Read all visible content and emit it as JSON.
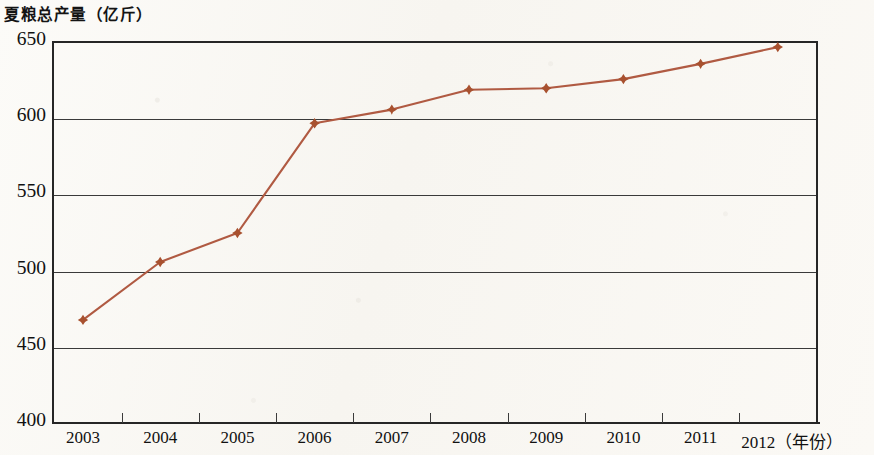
{
  "chart_data": {
    "type": "line",
    "title": "夏粮总产量（亿斤）",
    "xlabel": "（年份）",
    "ylabel": "",
    "categories": [
      "2003",
      "2004",
      "2005",
      "2006",
      "2007",
      "2008",
      "2009",
      "2010",
      "2011",
      "2012"
    ],
    "values": [
      467,
      505,
      524,
      596,
      605,
      618,
      619,
      625,
      635,
      646
    ],
    "series": [
      {
        "name": "夏粮总产量",
        "values": [
          467,
          505,
          524,
          596,
          605,
          618,
          619,
          625,
          635,
          646
        ]
      }
    ],
    "ylim": [
      400,
      650
    ],
    "yticks": [
      400,
      450,
      500,
      550,
      600,
      650
    ],
    "ytick_labels": [
      "400",
      "450",
      "500",
      "550",
      "600",
      "650"
    ],
    "xtick_labels": [
      "2003",
      "2004",
      "2005",
      "2006",
      "2007",
      "2008",
      "2009",
      "2010",
      "2011",
      "2012"
    ],
    "x_axis_unit_label": "（年份）",
    "grid": true,
    "grid_axis": "y",
    "legend": false,
    "legend_position": "none",
    "marker": "diamond",
    "line_color": "#b05a42",
    "marker_color": "#a8512f",
    "axis_color": "#262626",
    "grid_color": "#3a3a3a",
    "background_color": "#fbfaf7"
  },
  "axis": {
    "y_ticks": [
      {
        "label": "650",
        "value": 650
      },
      {
        "label": "600",
        "value": 600
      },
      {
        "label": "550",
        "value": 550
      },
      {
        "label": "500",
        "value": 500
      },
      {
        "label": "450",
        "value": 450
      },
      {
        "label": "400",
        "value": 400
      }
    ],
    "x_ticks": [
      {
        "label": "2003",
        "value": 2003
      },
      {
        "label": "2004",
        "value": 2004
      },
      {
        "label": "2005",
        "value": 2005
      },
      {
        "label": "2006",
        "value": 2006
      },
      {
        "label": "2007",
        "value": 2007
      },
      {
        "label": "2008",
        "value": 2008
      },
      {
        "label": "2009",
        "value": 2009
      },
      {
        "label": "2010",
        "value": 2010
      },
      {
        "label": "2011",
        "value": 2011
      },
      {
        "label": "2012（年份）",
        "value": 2012
      }
    ]
  }
}
